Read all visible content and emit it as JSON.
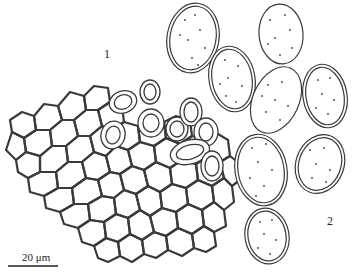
{
  "figure": {
    "panel_labels": {
      "panel1": "1",
      "panel2": "2"
    },
    "scale_bar": {
      "label": "20 μm"
    },
    "colors": {
      "ink": "#3a3a3a",
      "background": "#ffffff"
    },
    "panels": [
      {
        "id": "1",
        "description": "polygonal cellular network (pseudoparenchyma) with ring-like spores"
      },
      {
        "id": "2",
        "description": "ellipsoid spores with punctate ornamentation and spiny double wall"
      }
    ]
  }
}
